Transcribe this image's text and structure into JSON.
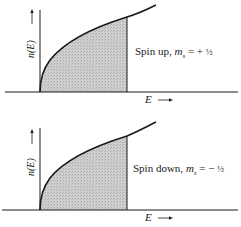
{
  "figure": {
    "panels": [
      {
        "id": "spin-up",
        "y_label": "n(E) →",
        "x_label": "E →",
        "caption": "Spin up, mₛ = +½",
        "caption_parts": {
          "text": "Spin up, ",
          "var": "m",
          "sub": "s",
          "eq": " = + ",
          "frac": "½"
        }
      },
      {
        "id": "spin-down",
        "y_label": "n(E) →",
        "x_label": "E →",
        "caption": "Spin down, mₛ = −½",
        "caption_parts": {
          "text": "Spin down, ",
          "var": "m",
          "sub": "s",
          "eq": " = − ",
          "frac": "½"
        }
      }
    ],
    "colors": {
      "line": "#1a1a1a",
      "fill": "#c8c8c8",
      "background": "#ffffff"
    }
  }
}
